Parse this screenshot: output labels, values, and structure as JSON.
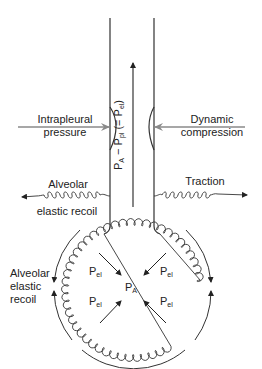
{
  "diagram": {
    "labels": {
      "intrapleural_line1": "Intrapleural",
      "intrapleural_line2": "pressure",
      "dynamic_line1": "Dynamic",
      "dynamic_line2": "compression",
      "alveolar_recoil_top_line1": "Alveolar",
      "alveolar_recoil_top_line2": "elastic recoil",
      "traction": "Traction",
      "alveolar_recoil_side_line1": "Alveolar",
      "alveolar_recoil_side_line2": "elastic",
      "alveolar_recoil_side_line3": "recoil"
    },
    "vertical_label": {
      "p": "P",
      "a_sub": "A",
      "minus": " − P",
      "pl_sub": "pl",
      "paren_open": " (= P",
      "el_sub": "el",
      "paren_close": ")"
    },
    "symbols": {
      "p": "P",
      "el": "el",
      "a": "A"
    },
    "colors": {
      "line": "#222222",
      "arrow_gray": "#8a8a8a",
      "text": "#222222"
    }
  }
}
